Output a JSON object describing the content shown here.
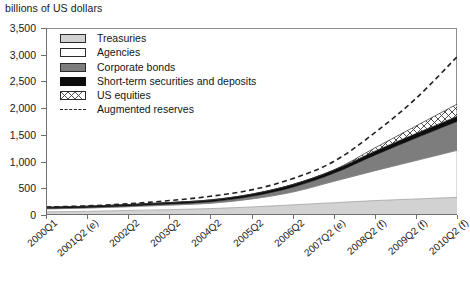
{
  "chart_data": {
    "type": "area",
    "title": "",
    "ylabel": "billions of US dollars",
    "xlabel": "",
    "ylim": [
      0,
      3500
    ],
    "yticks": [
      0,
      500,
      1000,
      1500,
      2000,
      2500,
      3000,
      3500
    ],
    "ytick_labels": [
      "0",
      "500",
      "1,000",
      "1,500",
      "2,000",
      "2,500",
      "3,000",
      "3,500"
    ],
    "grid": false,
    "legend_position": "upper-left",
    "stacked": true,
    "categories": [
      "2000Q1",
      "2001Q2 (e)",
      "2002Q2",
      "2003Q2",
      "2004Q2",
      "2005Q2",
      "2006Q2",
      "2007Q2 (e)",
      "2008Q2 (f)",
      "2009Q2 (f)",
      "2010Q2 (f)"
    ],
    "series": [
      {
        "name": "Treasuries",
        "color": "#d2d2d2",
        "fill": "solid",
        "values": [
          60,
          70,
          85,
          100,
          120,
          150,
          190,
          230,
          270,
          300,
          330
        ]
      },
      {
        "name": "Agencies",
        "color": "#ffffff",
        "fill": "solid",
        "values": [
          55,
          60,
          70,
          85,
          100,
          150,
          240,
          400,
          560,
          720,
          880
        ]
      },
      {
        "name": "Corporate bonds",
        "color": "#7d7d7d",
        "fill": "solid",
        "values": [
          10,
          12,
          15,
          20,
          30,
          50,
          90,
          150,
          290,
          420,
          540
        ]
      },
      {
        "name": "Short-term securities and deposits",
        "color": "#0d0d0d",
        "fill": "solid",
        "values": [
          20,
          22,
          25,
          28,
          32,
          40,
          50,
          60,
          75,
          85,
          95
        ]
      },
      {
        "name": "US equities",
        "color": "#ffffff",
        "fill": "crosshatch",
        "values": [
          0,
          0,
          0,
          0,
          0,
          0,
          0,
          0,
          60,
          140,
          230
        ]
      }
    ],
    "line_series": [
      {
        "name": "Augmented reserves",
        "style": "dashed",
        "color": "#202020",
        "values": [
          150,
          170,
          210,
          270,
          350,
          470,
          680,
          1000,
          1540,
          2180,
          2960
        ]
      }
    ]
  },
  "legend": {
    "items": [
      {
        "label": "Treasuries",
        "swatch": "treasuries-swatch"
      },
      {
        "label": "Agencies",
        "swatch": "agencies-swatch"
      },
      {
        "label": "Corporate bonds",
        "swatch": "corporate-bonds-swatch"
      },
      {
        "label": "Short-term securities and deposits",
        "swatch": "short-term-swatch"
      },
      {
        "label": "US equities",
        "swatch": "us-equities-swatch"
      },
      {
        "label": "Augmented reserves",
        "swatch": "augmented-reserves-dash"
      }
    ]
  }
}
